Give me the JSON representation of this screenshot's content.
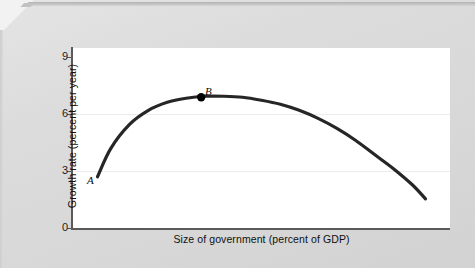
{
  "figure": {
    "plot_background": "#ffffff",
    "page_background": "#d9d9d9",
    "axis_color": "#5a5a5a",
    "curve_color": "#262626",
    "gridline_color": "#ececec"
  },
  "axes": {
    "y_label": "Growth rate (percent per year)",
    "x_label": "Size of government (percent of GDP)",
    "y_ticks": [
      "0",
      "3",
      "6",
      "9"
    ],
    "x_ticks": []
  },
  "annotations": {
    "point_a_label": "A",
    "point_b_label": "B"
  },
  "chart_data": {
    "type": "line",
    "title": "",
    "subtitle": "",
    "xlabel": "Size of government (percent of GDP)",
    "ylabel": "Growth rate (percent per year)",
    "xlim": [
      0,
      100
    ],
    "ylim": [
      0,
      9
    ],
    "yticks": [
      0,
      3,
      6,
      9
    ],
    "xticks": [],
    "grid": true,
    "grid_lines_at_y": [
      3,
      6
    ],
    "legend": null,
    "legend_position": "none",
    "series": [
      {
        "name": "Growth rate vs size of government",
        "note": "Inverted-U (Armey curve): growth rises with government size up to a maximum, then falls.",
        "x": [
          6.5,
          10,
          15,
          20,
          25,
          30,
          35,
          40,
          45,
          50,
          55,
          60,
          65,
          70,
          75,
          80,
          85,
          90,
          93.5
        ],
        "y": [
          2.6,
          4.0,
          5.2,
          5.9,
          6.3,
          6.5,
          6.6,
          6.6,
          6.55,
          6.4,
          6.2,
          5.9,
          5.5,
          5.0,
          4.4,
          3.7,
          3.0,
          2.2,
          1.5
        ]
      }
    ],
    "annotations": [
      {
        "label": "A",
        "x": 6.5,
        "y": 2.6,
        "marker": "none",
        "label_position": "left",
        "style": "italic"
      },
      {
        "label": "B",
        "x": 34,
        "y": 6.55,
        "marker": "filled-circle",
        "label_position": "above",
        "style": "italic"
      }
    ]
  }
}
